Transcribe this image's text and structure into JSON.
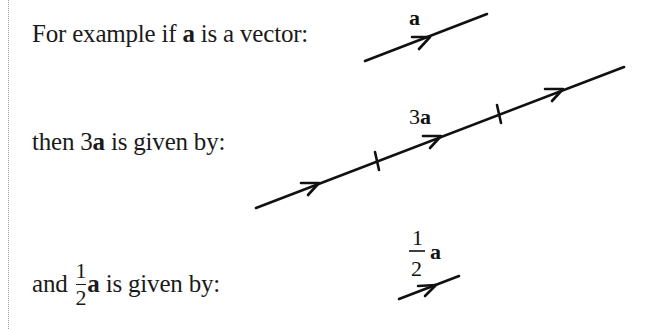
{
  "lines": [
    {
      "prefix": "For example if ",
      "bold": "a",
      "suffix": " is a vector:"
    },
    {
      "prefix": "then 3",
      "bold": "a",
      "suffix": " is given by:"
    },
    {
      "prefix": "and ",
      "fraction": {
        "numerator": "1",
        "denominator": "2"
      },
      "bold": "a",
      "suffix": " is given by:"
    }
  ],
  "diagrams": {
    "vector_a": {
      "label": "a",
      "start": [
        365,
        61
      ],
      "end": [
        487,
        14
      ],
      "arrowheads": 1,
      "ticks": 0
    },
    "vector_3a": {
      "label_coef": "3",
      "label_bold": "a",
      "start": [
        256,
        208
      ],
      "end": [
        624,
        67
      ],
      "arrowheads": 3,
      "ticks": 2
    },
    "vector_half_a": {
      "label_numerator": "1",
      "label_denominator": "2",
      "label_bold": "a",
      "start": [
        399,
        299
      ],
      "end": [
        459,
        276
      ],
      "arrowheads": 1,
      "ticks": 0
    }
  },
  "colors": {
    "text": "#1a1a1a",
    "line": "#111111",
    "rule": "#9a9a9a"
  }
}
